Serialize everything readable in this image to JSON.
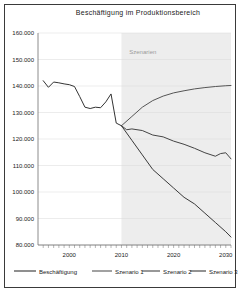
{
  "chart_data": {
    "type": "line",
    "title": "Beschäftigung im Produktionsbereich",
    "xlabel": "",
    "ylabel": "",
    "xlim": [
      1994,
      2031
    ],
    "ylim": [
      80000,
      160000
    ],
    "ytick_values": [
      160000,
      150000,
      140000,
      130000,
      120000,
      110000,
      100000,
      90000,
      80000
    ],
    "ytick_labels": [
      "160.000",
      "150.000",
      "140.000",
      "130.000",
      "120.000",
      "110.000",
      "100.000",
      "90.000",
      "80.000"
    ],
    "xtick_labels": [
      "2000",
      "2010",
      "2020",
      "2030"
    ],
    "xtick_values": [
      2000,
      2010,
      2020,
      2030
    ],
    "minor_xticks_every": 1,
    "grid": true,
    "legend_position": "bottom",
    "annotations": [
      {
        "text": "Szenarien",
        "x": 2011.5,
        "y": 152000,
        "color": "#9a9a9a"
      }
    ],
    "shaded_region": {
      "x_start": 2010,
      "x_end": 2031,
      "color": "#ededed",
      "label": "Szenarien"
    },
    "series": [
      {
        "name": "Beschäftigung",
        "color": "#333333",
        "x": [
          1995,
          1996,
          1997,
          1998,
          1999,
          2000,
          2001,
          2002,
          2003,
          2004,
          2005,
          2006,
          2007,
          2008,
          2009,
          2010
        ],
        "values": [
          142000,
          139500,
          141500,
          141200,
          140800,
          140500,
          139800,
          136000,
          132000,
          131500,
          132000,
          131800,
          134000,
          137000,
          126000,
          125000
        ]
      },
      {
        "name": "Szenario 1",
        "color": "#555555",
        "x": [
          2010,
          2012,
          2014,
          2016,
          2018,
          2020,
          2022,
          2024,
          2026,
          2028,
          2030,
          2031
        ],
        "values": [
          125000,
          128500,
          132000,
          134500,
          136200,
          137400,
          138200,
          138900,
          139400,
          139800,
          140100,
          140200
        ]
      },
      {
        "name": "Szenario 2",
        "color": "#444444",
        "x": [
          2010,
          2011,
          2012,
          2014,
          2016,
          2018,
          2020,
          2022,
          2024,
          2026,
          2028,
          2029,
          2030,
          2031
        ],
        "values": [
          125000,
          123500,
          123800,
          123200,
          121500,
          120800,
          119200,
          118000,
          116500,
          114800,
          113500,
          114500,
          114800,
          112500
        ]
      },
      {
        "name": "Szenario 3",
        "color": "#3a3a3a",
        "x": [
          2010,
          2012,
          2014,
          2016,
          2018,
          2020,
          2022,
          2024,
          2026,
          2028,
          2030,
          2031
        ],
        "values": [
          125000,
          119500,
          114000,
          108500,
          105000,
          101500,
          98000,
          95500,
          92000,
          88500,
          85000,
          83000
        ]
      }
    ]
  },
  "legend": {
    "items": [
      {
        "label": "Beschäftigung",
        "color": "#333333"
      },
      {
        "label": "Szenario 1",
        "color": "#555555"
      },
      {
        "label": "Szenario 2",
        "color": "#444444"
      },
      {
        "label": "Szenario 3",
        "color": "#3a3a3a"
      }
    ]
  }
}
